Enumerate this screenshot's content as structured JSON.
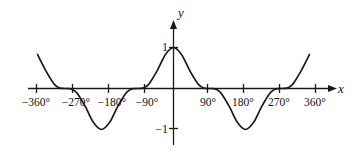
{
  "figure": {
    "title": "",
    "x_axis_label": "x",
    "y_axis_label": "y"
  },
  "chart_data": {
    "type": "line",
    "title": "",
    "xlabel": "x",
    "ylabel": "y",
    "grid": false,
    "legend": "none",
    "xlim": [
      -400,
      400
    ],
    "ylim": [
      -1.45,
      1.45
    ],
    "x_unit": "degrees",
    "x_tick_values": [
      -360,
      -270,
      -180,
      -90,
      90,
      180,
      270,
      360
    ],
    "x_tick_labels": [
      "−360°",
      "−270°",
      "−180°",
      "−90°",
      "90°",
      "180°",
      "270°",
      "360°"
    ],
    "y_tick_values": [
      1,
      -1
    ],
    "y_tick_labels": [
      "1",
      "−1"
    ],
    "series": [
      {
        "name": "flattened cosine",
        "description": "y = cos^3(x), period 360 degrees, amplitude 1, maxima at 0 and +/-360 degrees, minima at +/-180 degrees, zeros at +/-90 and +/-270 degrees",
        "color": "#1a1a1a",
        "x": [
          -400,
          -380,
          -360,
          -340,
          -320,
          -300,
          -290,
          -280,
          -270,
          -260,
          -250,
          -240,
          -220,
          -200,
          -180,
          -160,
          -140,
          -120,
          -110,
          -100,
          -90,
          -80,
          -70,
          -60,
          -40,
          -20,
          0,
          20,
          40,
          60,
          70,
          80,
          90,
          100,
          110,
          120,
          140,
          160,
          180,
          200,
          220,
          240,
          250,
          260,
          270,
          280,
          290,
          300,
          320,
          340,
          360,
          380,
          400
        ],
        "y": [
          0.45,
          0.84,
          1.0,
          0.83,
          0.45,
          0.13,
          0.04,
          0.005,
          0.0,
          -0.005,
          -0.04,
          -0.13,
          -0.45,
          -0.83,
          -1.0,
          -0.83,
          -0.45,
          -0.13,
          -0.04,
          -0.005,
          0.0,
          0.005,
          0.04,
          0.13,
          0.45,
          0.83,
          1.0,
          0.83,
          0.45,
          0.13,
          0.04,
          0.005,
          0.0,
          -0.005,
          -0.04,
          -0.13,
          -0.45,
          -0.83,
          -1.0,
          -0.83,
          -0.45,
          -0.13,
          -0.04,
          -0.005,
          0.0,
          0.005,
          0.04,
          0.13,
          0.45,
          0.83,
          1.0,
          0.84,
          0.45
        ]
      }
    ]
  },
  "ticks": {
    "x": [
      {
        "label": "−360°",
        "px": 36,
        "lx": 36
      },
      {
        "label": "−270°",
        "px": 72,
        "lx": 76
      },
      {
        "label": "−180°",
        "px": 108,
        "lx": 112
      },
      {
        "label": "−90°",
        "px": 144,
        "lx": 147
      }
    ],
    "x2": [
      {
        "label": "90°",
        "px": 207,
        "lx": 208
      },
      {
        "label": "180°",
        "px": 243,
        "lx": 243
      },
      {
        "label": "270°",
        "px": 279,
        "lx": 279
      },
      {
        "label": "360°",
        "px": 315,
        "lx": 315
      }
    ],
    "y": [
      {
        "label": "1",
        "py": 47
      },
      {
        "label": "−1",
        "py": 128
      }
    ]
  }
}
